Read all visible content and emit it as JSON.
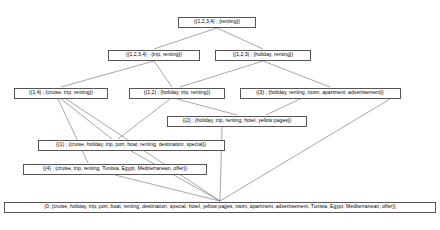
{
  "diagram": {
    "type": "hasse-diagram",
    "line_color": "#6b6b6b",
    "node_border_color": "#555555",
    "node_fill_color": "#ffffff",
    "text_color": "#000000",
    "nodes": [
      {
        "id": "top",
        "label": "{{1,2,3,4} ; {renting}}",
        "extent": "{1,2,3,4}",
        "intent": "{renting}",
        "cx": 217,
        "cy": 22,
        "w": 78
      },
      {
        "id": "n1234-trip",
        "label": "{{1,2,3,4} ; {trip, renting}}",
        "extent": "{1,2,3,4}",
        "intent": "{trip, renting}",
        "cx": 154,
        "cy": 55,
        "w": 92
      },
      {
        "id": "n123-holiday",
        "label": "{{1,2,3} ; {holiday, renting}}",
        "extent": "{1,2,3}",
        "intent": "{holiday, renting}",
        "cx": 263,
        "cy": 55,
        "w": 96
      },
      {
        "id": "n14",
        "label": "{{1,4} ; {cruise, trip, renting}}",
        "extent": "{1,4}",
        "intent": "{cruise, trip, renting}",
        "cx": 61,
        "cy": 93,
        "w": 94
      },
      {
        "id": "n12",
        "label": "{{1,2} ; {holiday, trip, renting}}",
        "extent": "{1,2}",
        "intent": "{holiday, trip, renting}",
        "cx": 177,
        "cy": 93,
        "w": 96
      },
      {
        "id": "n3",
        "label": "{{3} ; {holiday, renting, room, apartment, advertisement}}",
        "extent": "{3}",
        "intent": "{holiday, renting, room, apartment, advertisement}",
        "cx": 320,
        "cy": 93,
        "w": 161
      },
      {
        "id": "n2",
        "label": "{{2} ; {holiday, trip, renting, hotel, yellow pages}}",
        "extent": "{2}",
        "intent": "{holiday, trip, renting, hotel, yellow pages}",
        "cx": 237,
        "cy": 121,
        "w": 140
      },
      {
        "id": "n1",
        "label": "{{1} ; {cruise, holiday, trip, port, boat, renting, destination, special}}",
        "extent": "{1}",
        "intent": "{cruise, holiday, trip, port, boat, renting, destination, special}",
        "cx": 131,
        "cy": 145,
        "w": 187
      },
      {
        "id": "n4",
        "label": "{{4} ; {cruise, trip, renting, Tunisia, Egypt, Mediterranean, offer}}",
        "extent": "{4}",
        "intent": "{cruise, trip, renting, Tunisia, Egypt, Mediterranean, offer}",
        "cx": 115,
        "cy": 169,
        "w": 184
      },
      {
        "id": "bottom",
        "label": "{0; {cruise, holiday, trip, port, boat, renting, destination, special, hotel, yellow pages, room, apartment, advertisement, Tunisia, Egypt, Mediterranean, offer}}",
        "extent": "{0}",
        "intent": "{cruise, holiday, trip, port, boat, renting, destination, special, hotel, yellow pages, room, apartment, advertisement, Tunisia, Egypt, Mediterranean, offer}",
        "cx": 220,
        "cy": 207,
        "w": 432
      }
    ],
    "edges": [
      {
        "from": "top",
        "to": "n1234-trip",
        "x1": 217,
        "y1": 28,
        "x2": 154,
        "y2": 49
      },
      {
        "from": "top",
        "to": "n123-holiday",
        "x1": 217,
        "y1": 28,
        "x2": 263,
        "y2": 49
      },
      {
        "from": "n1234-trip",
        "to": "n14",
        "x1": 154,
        "y1": 61,
        "x2": 61,
        "y2": 87
      },
      {
        "from": "n1234-trip",
        "to": "n12",
        "x1": 154,
        "y1": 61,
        "x2": 172,
        "y2": 87
      },
      {
        "from": "n123-holiday",
        "to": "n12",
        "x1": 263,
        "y1": 61,
        "x2": 180,
        "y2": 87
      },
      {
        "from": "n123-holiday",
        "to": "n3",
        "x1": 263,
        "y1": 61,
        "x2": 330,
        "y2": 87
      },
      {
        "from": "n12",
        "to": "n2",
        "x1": 177,
        "y1": 99,
        "x2": 237,
        "y2": 115
      },
      {
        "from": "n3",
        "to": "n2",
        "x1": 300,
        "y1": 99,
        "x2": 266,
        "y2": 115
      },
      {
        "from": "n14",
        "to": "n1",
        "x1": 61,
        "y1": 99,
        "x2": 112,
        "y2": 139
      },
      {
        "from": "n14",
        "to": "n4",
        "x1": 58,
        "y1": 99,
        "x2": 88,
        "y2": 163
      },
      {
        "from": "n12",
        "to": "n1",
        "x1": 170,
        "y1": 99,
        "x2": 118,
        "y2": 139
      },
      {
        "from": "n1",
        "to": "bottom",
        "x1": 131,
        "y1": 151,
        "x2": 220,
        "y2": 201
      },
      {
        "from": "n4",
        "to": "bottom",
        "x1": 115,
        "y1": 175,
        "x2": 220,
        "y2": 201
      },
      {
        "from": "n2",
        "to": "bottom",
        "x1": 222,
        "y1": 127,
        "x2": 220,
        "y2": 201
      },
      {
        "from": "n3",
        "to": "bottom",
        "x1": 390,
        "y1": 99,
        "x2": 220,
        "y2": 201
      },
      {
        "from": "n14",
        "to": "bottom",
        "x1": 66,
        "y1": 99,
        "x2": 220,
        "y2": 201
      }
    ]
  }
}
